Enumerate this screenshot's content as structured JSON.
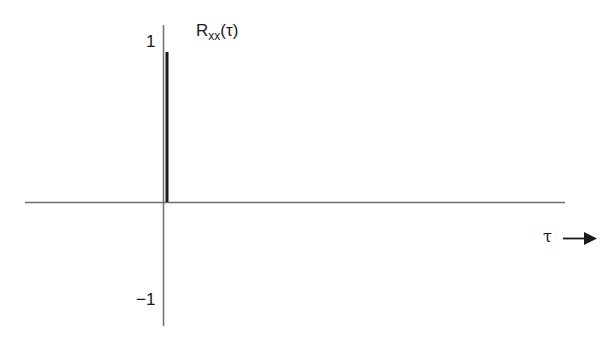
{
  "diagram": {
    "function_label": {
      "symbol": "R",
      "subscript": "xx",
      "argument": "(τ)"
    },
    "y_axis": {
      "tick_top": "1",
      "tick_bottom": "−1"
    },
    "x_axis": {
      "label": "τ",
      "arrow": "arrow-right"
    },
    "elements": [
      {
        "type": "horizontal-axis",
        "from_x": 25,
        "to_x": 565,
        "y": 202
      },
      {
        "type": "vertical-axis",
        "x": 163,
        "from_y": 25,
        "to_y": 326
      },
      {
        "type": "impulse",
        "x": 167,
        "from_y": 52,
        "to_y": 202,
        "height_value": 1
      }
    ],
    "colors": {
      "axis": "#6e6e6e",
      "impulse": "#1a1a1a",
      "text": "#1a1a1a"
    }
  }
}
